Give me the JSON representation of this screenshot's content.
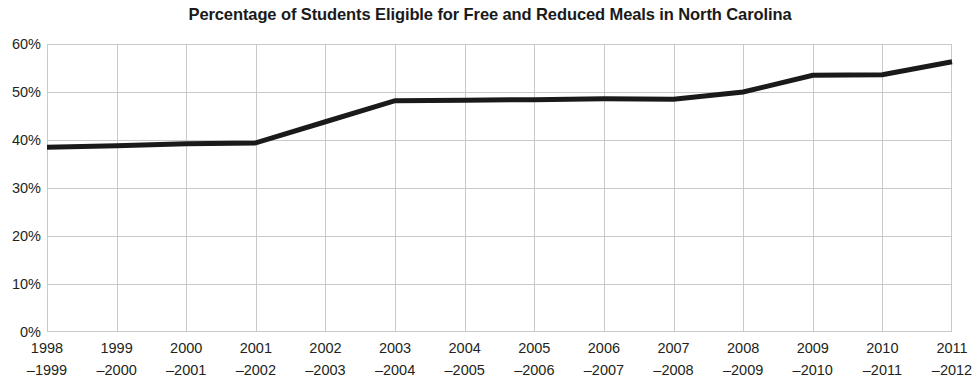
{
  "chart_data": {
    "type": "line",
    "title": "Percentage of Students Eligible for Free and Reduced Meals in North Carolina",
    "xlabel": "",
    "ylabel": "",
    "categories": [
      "1998–1999",
      "1999–2000",
      "2000–2001",
      "2001–2002",
      "2002–2003",
      "2003–2004",
      "2004–2005",
      "2005–2006",
      "2006–2007",
      "2007–2008",
      "2008–2009",
      "2009–2010",
      "2010–2011",
      "2011–2012"
    ],
    "values": [
      38.5,
      38.8,
      39.2,
      39.4,
      43.8,
      48.2,
      48.3,
      48.4,
      48.6,
      48.5,
      50.0,
      53.5,
      53.6,
      56.3
    ],
    "ylim": [
      0,
      60
    ],
    "ytick_step": 10,
    "ytick_labels": [
      "60%",
      "50%",
      "40%",
      "30%",
      "20%",
      "10%",
      "0%"
    ],
    "ytick_values": [
      60,
      50,
      40,
      30,
      20,
      10,
      0
    ],
    "grid": true,
    "legend": false,
    "series_color": "#1a1a1a",
    "grid_color": "#c9c9c9",
    "line_width": 5
  },
  "axis": {
    "x_labels_split": [
      {
        "start": "1998",
        "end": "–1999"
      },
      {
        "start": "1999",
        "end": "–2000"
      },
      {
        "start": "2000",
        "end": "–2001"
      },
      {
        "start": "2001",
        "end": "–2002"
      },
      {
        "start": "2002",
        "end": "–2003"
      },
      {
        "start": "2003",
        "end": "–2004"
      },
      {
        "start": "2004",
        "end": "–2005"
      },
      {
        "start": "2005",
        "end": "–2006"
      },
      {
        "start": "2006",
        "end": "–2007"
      },
      {
        "start": "2007",
        "end": "–2008"
      },
      {
        "start": "2008",
        "end": "–2009"
      },
      {
        "start": "2009",
        "end": "–2010"
      },
      {
        "start": "2010",
        "end": "–2011"
      },
      {
        "start": "2011",
        "end": "–2012"
      }
    ]
  }
}
